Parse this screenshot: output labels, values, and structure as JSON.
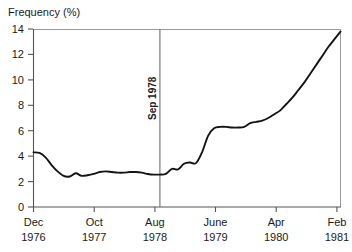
{
  "chart_data": {
    "type": "line",
    "title": "",
    "xlabel": "",
    "ylabel": "Frequency (%)",
    "ylim": [
      0,
      14
    ],
    "yticks": [
      0,
      2,
      4,
      6,
      8,
      10,
      12,
      14
    ],
    "ytick_labels": [
      "0",
      "2",
      "4",
      "6",
      "8",
      "10",
      "12",
      "14"
    ],
    "grid": false,
    "legend": null,
    "xtick_labels": [
      {
        "month": "Dec",
        "year": "1976"
      },
      {
        "month": "Oct",
        "year": "1977"
      },
      {
        "month": "Aug",
        "year": "1978"
      },
      {
        "month": "June",
        "year": "1979"
      },
      {
        "month": "Apr",
        "year": "1980"
      },
      {
        "month": "Feb",
        "year": "1981"
      }
    ],
    "xtick_positions": [
      0,
      10,
      20,
      30,
      40,
      50
    ],
    "xlim": [
      0,
      51
    ],
    "annotations": [
      {
        "label": "Sep 1978",
        "type": "vline",
        "x": 21,
        "orientation": "vertical"
      }
    ],
    "series": [
      {
        "name": "Frequency",
        "x": [
          0,
          1,
          2,
          3,
          4,
          5,
          6,
          7,
          8,
          9,
          10,
          11,
          12,
          13,
          14,
          15,
          16,
          17,
          18,
          19,
          20,
          21,
          22,
          23,
          24,
          25,
          26,
          27,
          28,
          29,
          30,
          31,
          32,
          33,
          34,
          35,
          36,
          37,
          38,
          39,
          40,
          41,
          42,
          43,
          44,
          45,
          46,
          47,
          48,
          49,
          50,
          51
        ],
        "values": [
          4.3,
          4.25,
          3.9,
          3.3,
          2.8,
          2.45,
          2.4,
          2.65,
          2.45,
          2.5,
          2.6,
          2.75,
          2.8,
          2.75,
          2.7,
          2.7,
          2.75,
          2.75,
          2.7,
          2.6,
          2.55,
          2.55,
          2.6,
          3.0,
          2.95,
          3.4,
          3.5,
          3.45,
          4.3,
          5.6,
          6.2,
          6.3,
          6.3,
          6.25,
          6.25,
          6.3,
          6.6,
          6.7,
          6.8,
          7.0,
          7.3,
          7.6,
          8.1,
          8.6,
          9.2,
          9.8,
          10.5,
          11.2,
          11.9,
          12.6,
          13.2,
          13.8
        ]
      }
    ]
  },
  "axes": {
    "y_axis_title": "Frequency (%)"
  }
}
